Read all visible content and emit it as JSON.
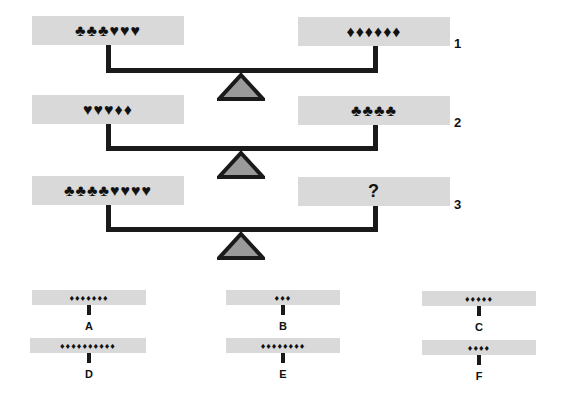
{
  "scales": [
    {
      "number": "1",
      "left": "♣♣♣♥♥♥",
      "right": "♦♦♦♦♦♦"
    },
    {
      "number": "2",
      "left": "♥♥♥♦♦",
      "right": "♣♣♣♣"
    },
    {
      "number": "3",
      "left": "♣♣♣♣♥♥♥♥",
      "right": "?"
    }
  ],
  "options": [
    {
      "label": "A",
      "symbols": "♦♦♦♦♦♦♦",
      "count": 7
    },
    {
      "label": "B",
      "symbols": "♦♦♦",
      "count": 3
    },
    {
      "label": "C",
      "symbols": "♦♦♦♦♦",
      "count": 5
    },
    {
      "label": "D",
      "symbols": "♦♦♦♦♦♦♦♦♦♦",
      "count": 10
    },
    {
      "label": "E",
      "symbols": "♦♦♦♦♦♦♦♦",
      "count": 8
    },
    {
      "label": "F",
      "symbols": "♦♦♦♦",
      "count": 4
    }
  ],
  "colors": {
    "panel": "#d9d9d9",
    "beam": "#1a1a1a",
    "fulcrum_fill": "#9a9a9a"
  }
}
